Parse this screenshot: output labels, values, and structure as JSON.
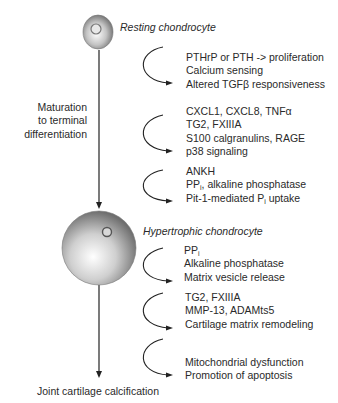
{
  "labels": {
    "resting": "Resting chondrocyte",
    "hypertrophic": "Hypertrophic chondrocyte",
    "maturation": [
      "Maturation",
      "to terminal",
      "differentiation"
    ],
    "outcome": "Joint cartilage calcification"
  },
  "blocks": [
    {
      "lines": [
        "PTHrP or PTH -> proliferation",
        "Calcium sensing",
        "Altered TGFβ responsiveness"
      ]
    },
    {
      "lines": [
        "CXCL1, CXCL8, TNFα",
        "TG2, FXIIIA",
        "S100 calgranulins, RAGE",
        "p38 signaling"
      ]
    },
    {
      "lines": [
        {
          "pre": "ANKH",
          "sub": "",
          "post": ""
        },
        {
          "pre": "PP",
          "sub": "i",
          "post": ", alkaline phosphatase"
        },
        {
          "pre": "Pit-1-mediated P",
          "sub": "i",
          "post": " uptake"
        }
      ]
    },
    {
      "lines": [
        {
          "pre": "PP",
          "sub": "i",
          "post": ""
        },
        {
          "pre": "Alkaline phosphatase",
          "sub": "",
          "post": ""
        },
        {
          "pre": "Matrix vesicle release",
          "sub": "",
          "post": ""
        }
      ]
    },
    {
      "lines": [
        "TG2, FXIIIA",
        "MMP-13, ADAMts5",
        "Cartilage matrix remodeling"
      ]
    },
    {
      "lines": [
        "Mitochondrial dysfunction",
        "Promotion of apoptosis"
      ]
    }
  ],
  "colors": {
    "line": "#222222",
    "sphere_light": "#ffffff",
    "sphere_dark": "#6e6e6e"
  }
}
